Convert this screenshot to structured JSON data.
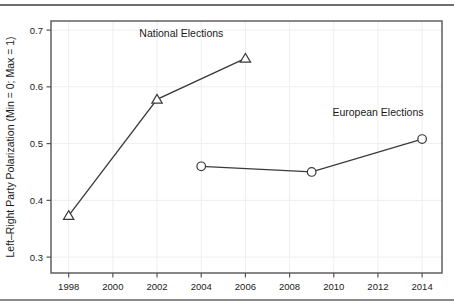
{
  "chart_data": {
    "type": "line",
    "title": "",
    "xlabel": "",
    "ylabel": "Left–Right Party Polarization (Min = 0; Max = 1)",
    "xlim": [
      1997.2,
      2014.9
    ],
    "ylim": [
      0.272,
      0.716
    ],
    "xticks": [
      1998,
      2000,
      2002,
      2004,
      2006,
      2008,
      2010,
      2012,
      2014
    ],
    "xticklabels": [
      "1998",
      "2000",
      "2002",
      "2004",
      "2006",
      "2008",
      "2010",
      "2012",
      "2014"
    ],
    "yticks": [
      0.3,
      0.4,
      0.5,
      0.6,
      0.7
    ],
    "yticklabels": [
      "0.3",
      "0.4",
      "0.5",
      "0.6",
      "0.7"
    ],
    "grid": true,
    "legend_position": "inline-annotations",
    "series": [
      {
        "name": "National Elections",
        "marker": "triangle",
        "color": "#3a3a3a",
        "x": [
          1998,
          2002,
          2006
        ],
        "values": [
          0.373,
          0.578,
          0.65
        ],
        "annotation": {
          "text": "National Elections",
          "x": 2003.1,
          "y": 0.687
        }
      },
      {
        "name": "European Elections",
        "marker": "circle",
        "color": "#3a3a3a",
        "x": [
          2004,
          2009,
          2014
        ],
        "values": [
          0.46,
          0.45,
          0.508
        ],
        "annotation": {
          "text": "European Elections",
          "x": 2012.0,
          "y": 0.549
        }
      }
    ]
  },
  "axis": {
    "y_title": "Left–Right Party Polarization (Min = 0; Max = 1)"
  },
  "annotations": {
    "national": "National Elections",
    "european": "European Elections"
  },
  "ticks": {
    "x": [
      "1998",
      "2000",
      "2002",
      "2004",
      "2006",
      "2008",
      "2010",
      "2012",
      "2014"
    ],
    "y": [
      "0.3",
      "0.4",
      "0.5",
      "0.6",
      "0.7"
    ]
  }
}
